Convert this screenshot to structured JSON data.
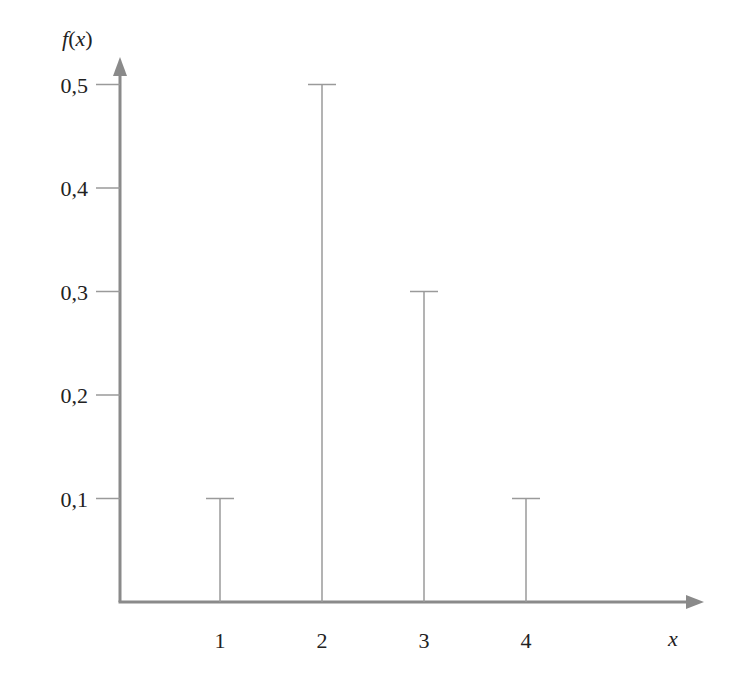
{
  "chart_data": {
    "type": "bar",
    "subtype": "stem",
    "title": "",
    "xlabel": "x",
    "ylabel": "f(x)",
    "categories": [
      "1",
      "2",
      "3",
      "4"
    ],
    "x": [
      1,
      2,
      3,
      4
    ],
    "values": [
      0.1,
      0.5,
      0.3,
      0.1
    ],
    "ylim": [
      0,
      0.5
    ],
    "y_ticks": [
      0.1,
      0.2,
      0.3,
      0.4,
      0.5
    ],
    "y_tick_labels": [
      "0,1",
      "0,2",
      "0,3",
      "0,4",
      "0,5"
    ],
    "x_tick_labels": [
      "1",
      "2",
      "3",
      "4"
    ],
    "grid": false,
    "legend": null
  },
  "labels": {
    "ylabel": "f(x)",
    "xlabel": "x"
  },
  "colors": {
    "axis": "#8a8a8a",
    "stem": "#9a9a9a",
    "text": "#222222"
  }
}
